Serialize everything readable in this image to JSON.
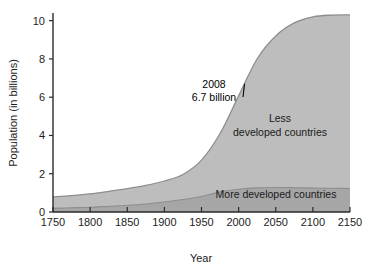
{
  "chart_data": {
    "type": "area",
    "title": "",
    "subtitle": "",
    "xlabel": "Year",
    "ylabel": "Population (in billions)",
    "xlim": [
      1750,
      2150
    ],
    "ylim": [
      0,
      10.4
    ],
    "xticks": [
      1750,
      1800,
      1850,
      1900,
      1950,
      2000,
      2050,
      2100,
      2150
    ],
    "xtick_labels": [
      "1750",
      "1800",
      "1850",
      "1900",
      "1950",
      "2000",
      "2050",
      "2100",
      "2150"
    ],
    "yticks": [
      0,
      2,
      4,
      6,
      8,
      10
    ],
    "ytick_labels": [
      "0",
      "2",
      "4",
      "6",
      "8",
      "10"
    ],
    "grid": false,
    "legend_position": "inline-band-labels",
    "stacked": true,
    "x": [
      1750,
      1775,
      1800,
      1825,
      1850,
      1875,
      1900,
      1925,
      1950,
      1975,
      2000,
      2025,
      2050,
      2075,
      2100,
      2125,
      2150
    ],
    "series": [
      {
        "name": "More developed countries",
        "color": "#a6a6a6",
        "values": [
          0.19,
          0.22,
          0.25,
          0.3,
          0.35,
          0.42,
          0.52,
          0.65,
          0.81,
          1.05,
          1.19,
          1.26,
          1.28,
          1.27,
          1.25,
          1.24,
          1.23
        ]
      },
      {
        "name": "Less developed countries",
        "color": "#bdbdbd",
        "values": [
          0.6,
          0.64,
          0.7,
          0.78,
          0.87,
          0.97,
          1.1,
          1.31,
          1.9,
          3.05,
          4.88,
          6.75,
          7.92,
          8.61,
          8.95,
          9.05,
          9.07
        ]
      }
    ],
    "totals": [
      0.79,
      0.86,
      0.95,
      1.08,
      1.22,
      1.39,
      1.62,
      1.96,
      2.71,
      4.1,
      6.07,
      8.01,
      9.2,
      9.88,
      10.2,
      10.29,
      10.3
    ],
    "annotations": [
      {
        "name": "2008-annotation",
        "line1": "2008",
        "line2": "6.7 billion",
        "x": 2008,
        "y": 6.7,
        "leader": true
      }
    ],
    "band_labels": [
      {
        "name": "less-developed",
        "line1": "Less",
        "line2": "developed countries"
      },
      {
        "name": "more-developed",
        "line1": "More developed countries",
        "line2": ""
      }
    ]
  },
  "colors": {
    "upper_band": "#bdbdbd",
    "lower_band": "#a6a6a6",
    "band_edge": "#8e8e8e",
    "axis": "#2a2a2a",
    "text": "#1d1d1d",
    "background": "#ffffff"
  }
}
